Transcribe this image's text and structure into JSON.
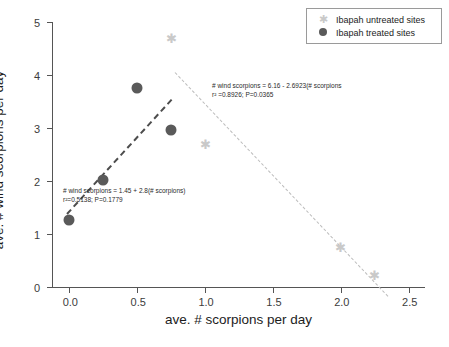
{
  "chart_data": {
    "type": "scatter",
    "title": "",
    "xlabel": "ave. # scorpions per day",
    "ylabel": "ave. # wind scorpions per day",
    "xlim": [
      -0.12,
      2.62
    ],
    "ylim": [
      0,
      5
    ],
    "xticks": [
      "0.0",
      "0.5",
      "1.0",
      "1.5",
      "2.0",
      "2.5"
    ],
    "xtick_values": [
      0.0,
      0.5,
      1.0,
      1.5,
      2.0,
      2.5
    ],
    "yticks": [
      "0",
      "1",
      "2",
      "3",
      "4",
      "5"
    ],
    "ytick_values": [
      0,
      1,
      2,
      3,
      4,
      5
    ],
    "grid": false,
    "legend_position": "top-right",
    "series": [
      {
        "name": "Ibapah untreated sites",
        "marker": "star",
        "color": "#c9c9c9",
        "points": [
          {
            "x": 0.75,
            "y": 4.7
          },
          {
            "x": 1.0,
            "y": 2.7
          },
          {
            "x": 2.0,
            "y": 0.75
          },
          {
            "x": 2.25,
            "y": 0.22
          }
        ],
        "fit": {
          "equation": "# wind scorpions = 6.16 - 2.6923(# scorpions)",
          "stats": "r²=0.8926; P=0.0365",
          "intercept": 6.16,
          "slope": -2.6923,
          "r_squared": 0.8926,
          "p_value": 0.0365,
          "x_start": 0.78,
          "x_end": 2.35,
          "style": "dash-dot"
        }
      },
      {
        "name": "Ibapah treated sites",
        "marker": "circle",
        "color": "#5a5a5a",
        "points": [
          {
            "x": 0.0,
            "y": 1.27
          },
          {
            "x": 0.25,
            "y": 2.02
          },
          {
            "x": 0.5,
            "y": 3.75
          },
          {
            "x": 0.75,
            "y": 2.97
          }
        ],
        "fit": {
          "equation": "# wind scorpions = 1.45 + 2.8(# scorpions)",
          "stats": "r²=0.5138; P=0.1779",
          "intercept": 1.45,
          "slope": 2.8,
          "r_squared": 0.5138,
          "p_value": 0.1779,
          "x_start": -0.02,
          "x_end": 0.75,
          "style": "dashed"
        }
      }
    ]
  },
  "legend": {
    "items": [
      {
        "label": "Ibapah untreated sites",
        "marker": "star-icon"
      },
      {
        "label": "Ibapah treated sites",
        "marker": "circle-icon"
      }
    ]
  },
  "annotations": [
    {
      "id": "untreated",
      "line1": "# wind scorpions = 6.16 - 2.6923(# scorpions",
      "line2": "r² =0.8926; P=0.0365"
    },
    {
      "id": "treated",
      "line1": "# wind scorpions = 1.45 + 2.8(# scorpions)",
      "line2": "r²=0.5138; P=0.1779"
    }
  ]
}
